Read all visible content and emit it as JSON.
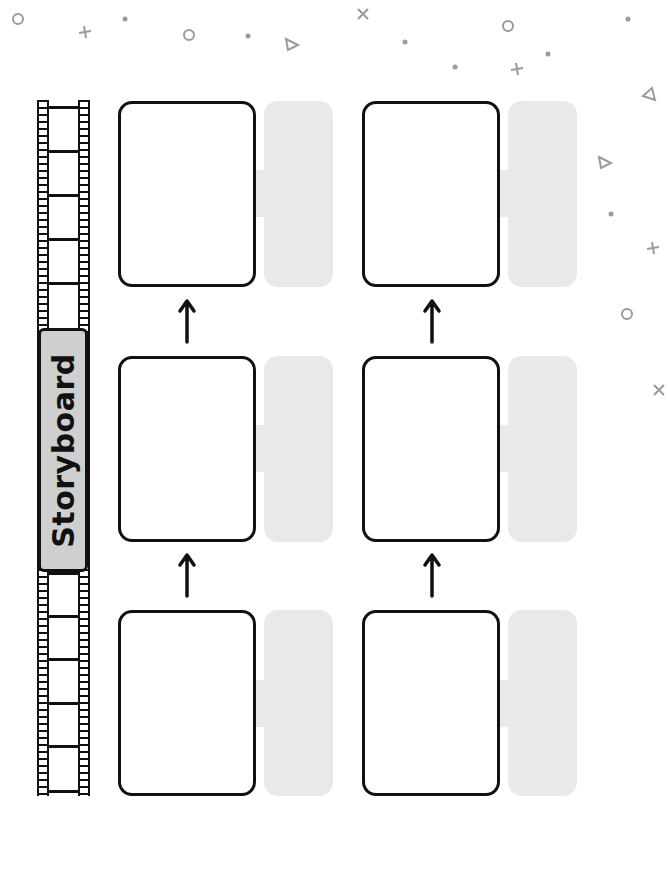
{
  "worksheet": {
    "title": "Storyboard",
    "layout": "landscape-rotated-90",
    "colors": {
      "background": "#ffffff",
      "outline": "#111111",
      "note_panel": "#e9e9e9",
      "title_plate": "#cfcfcf",
      "decorations": "#9a9a9a"
    },
    "panels": [
      {
        "id": 1,
        "label": ""
      },
      {
        "id": 2,
        "label": ""
      },
      {
        "id": 3,
        "label": ""
      },
      {
        "id": 4,
        "label": ""
      },
      {
        "id": 5,
        "label": ""
      },
      {
        "id": 6,
        "label": ""
      }
    ],
    "decorations": [
      "circle-icon",
      "plus-icon",
      "dot-icon",
      "triangle-icon",
      "x-icon"
    ]
  }
}
